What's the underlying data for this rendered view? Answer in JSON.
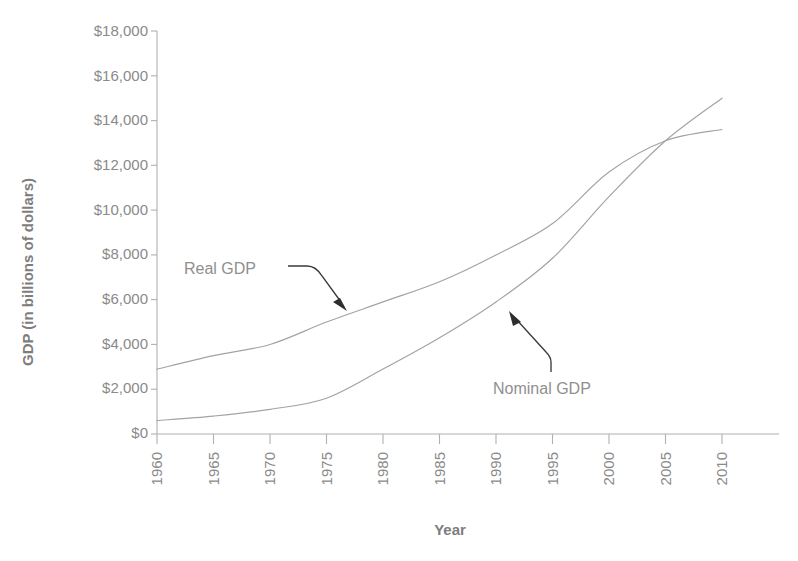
{
  "chart_data": {
    "type": "line",
    "title": "",
    "xlabel": "Year",
    "ylabel": "GDP (in billions of dollars)",
    "xlim": [
      1960,
      2010
    ],
    "ylim": [
      0,
      18000
    ],
    "grid": false,
    "legend_position": "inline-annotations",
    "x_tick_labels": [
      "1960",
      "1965",
      "1970",
      "1975",
      "1980",
      "1985",
      "1990",
      "1995",
      "2000",
      "2005",
      "2010"
    ],
    "y_tick_labels": [
      "$18,000",
      "$16,000",
      "$14,000",
      "$12,000",
      "$10,000",
      "$8,000",
      "$6,000",
      "$4,000",
      "$2,000",
      "$0"
    ],
    "y_tick_values": [
      18000,
      16000,
      14000,
      12000,
      10000,
      8000,
      6000,
      4000,
      2000,
      0
    ],
    "x": [
      1960,
      1965,
      1970,
      1975,
      1980,
      1985,
      1990,
      1995,
      2000,
      2005,
      2010
    ],
    "series": [
      {
        "name": "Real GDP",
        "values": [
          2900,
          3500,
          4000,
          5000,
          5900,
          6800,
          8000,
          9400,
          11700,
          13100,
          13600
        ],
        "color": "#a3a3a3"
      },
      {
        "name": "Nominal GDP",
        "values": [
          600,
          800,
          1100,
          1600,
          2900,
          4300,
          5900,
          7850,
          10600,
          13100,
          15000
        ],
        "color": "#a3a3a3"
      }
    ],
    "annotations": [
      {
        "text": "Real GDP",
        "points_to_series": "Real GDP",
        "points_to_year": 1973
      },
      {
        "text": "Nominal GDP",
        "points_to_series": "Nominal GDP",
        "points_to_year": 1989
      }
    ]
  },
  "axis": {
    "x_title": "Year",
    "y_title": "GDP (in billions of dollars)"
  },
  "labels": {
    "real_gdp": "Real GDP",
    "nominal_gdp": "Nominal GDP"
  },
  "y_ticks": [
    {
      "label": "$18,000"
    },
    {
      "label": "$16,000"
    },
    {
      "label": "$14,000"
    },
    {
      "label": "$12,000"
    },
    {
      "label": "$10,000"
    },
    {
      "label": "$8,000"
    },
    {
      "label": "$6,000"
    },
    {
      "label": "$4,000"
    },
    {
      "label": "$2,000"
    },
    {
      "label": "$0"
    }
  ],
  "x_ticks": [
    {
      "label": "1960"
    },
    {
      "label": "1965"
    },
    {
      "label": "1970"
    },
    {
      "label": "1975"
    },
    {
      "label": "1980"
    },
    {
      "label": "1985"
    },
    {
      "label": "1990"
    },
    {
      "label": "1995"
    },
    {
      "label": "2000"
    },
    {
      "label": "2005"
    },
    {
      "label": "2010"
    }
  ]
}
